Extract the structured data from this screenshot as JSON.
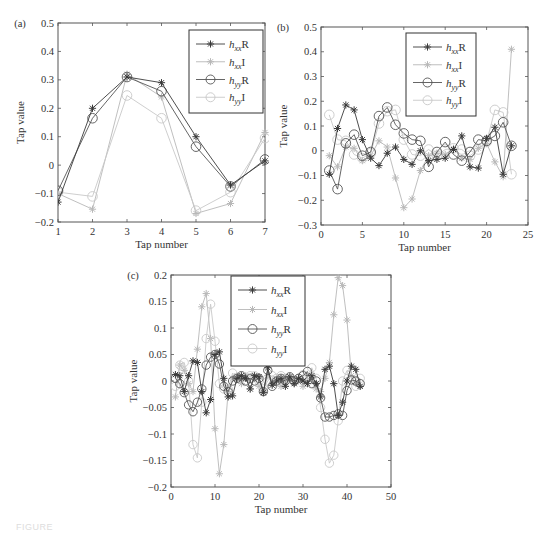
{
  "figure": {
    "caption_fragment": "FIGURE"
  },
  "legend_style": {
    "hxxR": {
      "color": "#3a3a3a",
      "marker": "star",
      "label_base": "h",
      "label_sub": "xx",
      "label_suffix": "R"
    },
    "hxxI": {
      "color": "#b8b8b8",
      "marker": "star",
      "label_base": "h",
      "label_sub": "xx",
      "label_suffix": "I"
    },
    "hyyR": {
      "color": "#555555",
      "marker": "circle",
      "label_base": "h",
      "label_sub": "yy",
      "label_suffix": "R"
    },
    "hyyI": {
      "color": "#c8c8c8",
      "marker": "circle",
      "label_base": "h",
      "label_sub": "yy",
      "label_suffix": "I"
    }
  },
  "chart_data": [
    {
      "id": "a",
      "panel_label": "(a)",
      "type": "line",
      "xlabel": "Tap number",
      "ylabel": "Tap value",
      "xlim": [
        1,
        7
      ],
      "ylim": [
        -0.2,
        0.5
      ],
      "xticks": [
        1,
        2,
        3,
        4,
        5,
        6,
        7
      ],
      "yticks": [
        -0.2,
        -0.1,
        0,
        0.1,
        0.2,
        0.3,
        0.4,
        0.5
      ],
      "ytick_labels": [
        "-0.2",
        "-0.1",
        "0",
        "0.1",
        "0.2",
        "0.3",
        "0.4",
        "0.5"
      ],
      "grid": false,
      "legend_position": "upper right",
      "legend": [
        "hxxR",
        "hxxI",
        "hyyR",
        "hyyI"
      ],
      "x": [
        1,
        2,
        3,
        4,
        5,
        6,
        7
      ],
      "series": [
        {
          "name": "hxxR",
          "values": [
            -0.13,
            0.2,
            0.31,
            0.29,
            0.1,
            -0.07,
            0.015
          ]
        },
        {
          "name": "hxxI",
          "values": [
            -0.1,
            -0.155,
            0.32,
            0.24,
            -0.17,
            -0.135,
            0.115
          ]
        },
        {
          "name": "hyyR",
          "values": [
            -0.09,
            0.165,
            0.31,
            0.26,
            0.065,
            -0.075,
            0.02
          ]
        },
        {
          "name": "hyyI",
          "values": [
            -0.095,
            -0.11,
            0.245,
            0.165,
            -0.16,
            -0.095,
            0.095
          ]
        }
      ]
    },
    {
      "id": "b",
      "panel_label": "(b)",
      "type": "line",
      "xlabel": "Tap number",
      "ylabel": "Tap value",
      "xlim": [
        0,
        25
      ],
      "ylim": [
        -0.3,
        0.5
      ],
      "xticks": [
        0,
        5,
        10,
        15,
        20,
        25
      ],
      "yticks": [
        -0.3,
        -0.2,
        -0.1,
        0,
        0.1,
        0.2,
        0.3,
        0.4,
        0.5
      ],
      "ytick_labels": [
        "-0.3",
        "-0.2",
        "-0.1",
        "0",
        "0.1",
        "0.2",
        "0.3",
        "0.4",
        "0.5"
      ],
      "grid": false,
      "legend_position": "upper center",
      "legend": [
        "hxxR",
        "hxxI",
        "hyyR",
        "hyyI"
      ],
      "x": [
        1,
        2,
        3,
        4,
        5,
        6,
        7,
        8,
        9,
        10,
        11,
        12,
        13,
        14,
        15,
        16,
        17,
        18,
        19,
        20,
        21,
        22,
        23
      ],
      "series": [
        {
          "name": "hxxR",
          "values": [
            -0.095,
            0.09,
            0.185,
            0.165,
            0.045,
            -0.03,
            -0.06,
            -0.01,
            0.015,
            -0.035,
            -0.055,
            0.0,
            -0.04,
            -0.035,
            -0.03,
            0.005,
            0.06,
            -0.065,
            -0.07,
            0.05,
            0.095,
            -0.095,
            0.02
          ]
        },
        {
          "name": "hxxI",
          "values": [
            -0.02,
            -0.065,
            0.015,
            0.01,
            -0.04,
            -0.02,
            0.04,
            0.015,
            -0.11,
            -0.23,
            -0.195,
            -0.08,
            -0.02,
            -0.01,
            -0.015,
            0.01,
            -0.03,
            -0.035,
            0.01,
            0.03,
            -0.045,
            -0.105,
            0.41
          ]
        },
        {
          "name": "hyyR",
          "values": [
            -0.08,
            -0.155,
            0.03,
            0.065,
            -0.02,
            -0.005,
            0.14,
            0.175,
            0.105,
            0.07,
            0.045,
            0.04,
            -0.065,
            -0.005,
            0.035,
            -0.015,
            -0.04,
            -0.005,
            0.045,
            0.04,
            0.06,
            0.115,
            0.02
          ]
        },
        {
          "name": "hyyI",
          "values": [
            0.145,
            0.045,
            0.04,
            -0.015,
            -0.03,
            -0.01,
            0.11,
            0.16,
            0.165,
            0.045,
            -0.015,
            -0.02,
            0.005,
            -0.02,
            0.005,
            0.01,
            0.005,
            -0.02,
            0.005,
            0.035,
            0.165,
            0.155,
            -0.095
          ]
        }
      ]
    },
    {
      "id": "c",
      "panel_label": "(c)",
      "type": "line",
      "xlabel": "Tap number",
      "ylabel": "Tap value",
      "xlim": [
        0,
        50
      ],
      "ylim": [
        -0.2,
        0.2
      ],
      "xticks": [
        0,
        10,
        20,
        30,
        40,
        50
      ],
      "yticks": [
        -0.2,
        -0.15,
        -0.1,
        -0.05,
        0,
        0.05,
        0.1,
        0.15,
        0.2
      ],
      "ytick_labels": [
        "-0.2",
        "-0.15",
        "-0.1",
        "-0.05",
        "0",
        "0.05",
        "0.1",
        "0.15",
        "0.2"
      ],
      "grid": false,
      "legend_position": "upper center",
      "legend": [
        "hxxR",
        "hxxI",
        "hyyR",
        "hyyI"
      ],
      "x": [
        1,
        2,
        3,
        4,
        5,
        6,
        7,
        8,
        9,
        10,
        11,
        12,
        13,
        14,
        15,
        16,
        17,
        18,
        19,
        20,
        21,
        22,
        23,
        24,
        25,
        26,
        27,
        28,
        29,
        30,
        31,
        32,
        33,
        34,
        35,
        36,
        37,
        38,
        39,
        40,
        41,
        42,
        43
      ],
      "series": [
        {
          "name": "hxxR",
          "values": [
            0.012,
            0.01,
            -0.02,
            0.01,
            0.038,
            0.035,
            -0.02,
            -0.06,
            -0.035,
            0.05,
            0.055,
            0.005,
            -0.03,
            -0.028,
            0.005,
            0.01,
            0.005,
            -0.015,
            0.01,
            0.008,
            -0.022,
            0.025,
            -0.008,
            0.0,
            0.005,
            -0.01,
            0.008,
            -0.005,
            0.005,
            0.0,
            -0.005,
            0.01,
            -0.005,
            -0.03,
            0.022,
            0.028,
            -0.005,
            -0.065,
            -0.04,
            0.0,
            0.028,
            0.022,
            -0.01
          ]
        },
        {
          "name": "hxxI",
          "values": [
            -0.03,
            0.03,
            0.02,
            -0.005,
            -0.02,
            0.06,
            0.14,
            0.165,
            0.08,
            -0.09,
            -0.175,
            -0.12,
            -0.02,
            0.005,
            0.01,
            -0.005,
            0.01,
            -0.015,
            0.005,
            -0.01,
            -0.02,
            0.01,
            -0.005,
            0.005,
            -0.01,
            0.0,
            0.005,
            -0.005,
            0.0,
            -0.01,
            0.0,
            0.005,
            -0.015,
            -0.02,
            0.005,
            0.035,
            0.125,
            0.195,
            0.18,
            0.115,
            0.01,
            -0.005,
            -0.01
          ]
        },
        {
          "name": "hyyR",
          "values": [
            0.005,
            -0.005,
            -0.022,
            -0.045,
            -0.058,
            -0.04,
            -0.015,
            0.03,
            0.045,
            0.05,
            0.032,
            -0.01,
            -0.02,
            0.0,
            0.005,
            0.01,
            0.0,
            0.005,
            0.0,
            0.005,
            -0.02,
            0.02,
            -0.01,
            0.0,
            0.005,
            0.0,
            0.008,
            0.0,
            0.005,
            0.01,
            0.018,
            -0.005,
            0.0,
            -0.032,
            -0.068,
            -0.068,
            -0.065,
            -0.062,
            -0.065,
            -0.018,
            0.002,
            0.0,
            -0.005
          ]
        },
        {
          "name": "hyyI",
          "values": [
            -0.01,
            0.03,
            0.035,
            0.0,
            -0.12,
            -0.145,
            -0.04,
            0.08,
            0.145,
            0.075,
            -0.005,
            -0.015,
            -0.015,
            0.015,
            0.005,
            0.005,
            0.0,
            0.01,
            0.01,
            0.0,
            -0.015,
            0.0,
            0.01,
            0.005,
            0.01,
            0.005,
            0.005,
            0.0,
            0.005,
            0.012,
            0.005,
            0.025,
            0.005,
            -0.05,
            -0.11,
            -0.155,
            -0.14,
            -0.075,
            0.0,
            0.02,
            0.015,
            -0.01,
            0.005
          ]
        }
      ]
    }
  ],
  "layout": {
    "a": {
      "left": 58,
      "top": 23,
      "width": 207,
      "height": 199,
      "legend": {
        "x": 189,
        "y": 30,
        "w": 74,
        "h": 83
      }
    },
    "b": {
      "left": 321,
      "top": 27,
      "width": 207,
      "height": 198,
      "legend": {
        "x": 406,
        "y": 33,
        "w": 70,
        "h": 83
      }
    },
    "c": {
      "left": 171,
      "top": 275,
      "width": 220,
      "height": 212,
      "legend": {
        "x": 231,
        "y": 276,
        "w": 74,
        "h": 90
      }
    }
  }
}
